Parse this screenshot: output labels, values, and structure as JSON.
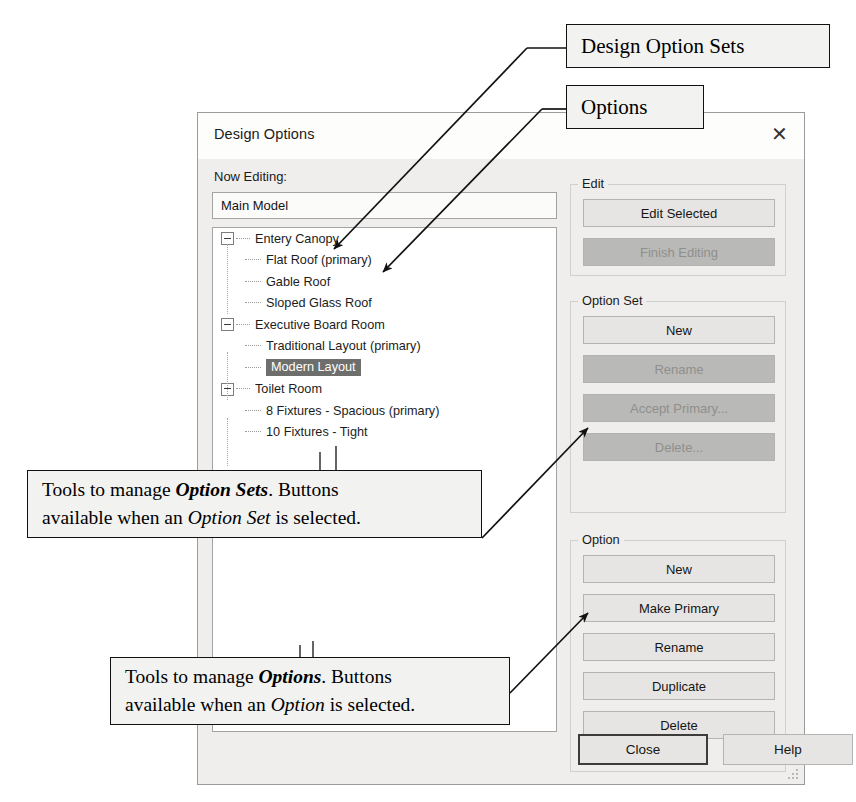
{
  "dialog": {
    "title": "Design Options",
    "close_icon": "close-x-icon",
    "now_editing_label": "Now Editing:",
    "now_editing_value": "Main Model",
    "tree": [
      {
        "type": "set",
        "label": "Entery Canopy",
        "selected": false
      },
      {
        "type": "option",
        "label": "Flat Roof (primary)",
        "selected": false
      },
      {
        "type": "option",
        "label": "Gable Roof",
        "selected": false
      },
      {
        "type": "option",
        "label": "Sloped Glass Roof",
        "selected": false
      },
      {
        "type": "set",
        "label": "Executive Board Room",
        "selected": false
      },
      {
        "type": "option",
        "label": "Traditional Layout (primary)",
        "selected": false
      },
      {
        "type": "option",
        "label": "Modern Layout",
        "selected": true
      },
      {
        "type": "set",
        "label": "Toilet Room",
        "selected": false
      },
      {
        "type": "option",
        "label": "8 Fixtures - Spacious (primary)",
        "selected": false
      },
      {
        "type": "option",
        "label": "10 Fixtures - Tight",
        "selected": false
      }
    ],
    "groups": [
      {
        "title": "Edit",
        "buttons": [
          {
            "label": "Edit Selected",
            "enabled": true
          },
          {
            "label": "Finish Editing",
            "enabled": false
          }
        ]
      },
      {
        "title": "Option Set",
        "buttons": [
          {
            "label": "New",
            "enabled": true
          },
          {
            "label": "Rename",
            "enabled": false
          },
          {
            "label": "Accept Primary...",
            "enabled": false
          },
          {
            "label": "Delete...",
            "enabled": false
          }
        ]
      },
      {
        "title": "Option",
        "buttons": [
          {
            "label": "New",
            "enabled": true
          },
          {
            "label": "Make Primary",
            "enabled": true
          },
          {
            "label": "Rename",
            "enabled": true
          },
          {
            "label": "Duplicate",
            "enabled": true
          },
          {
            "label": "Delete",
            "enabled": true
          }
        ]
      }
    ],
    "footer": {
      "close_label": "Close",
      "help_label": "Help"
    }
  },
  "annotations": {
    "design_option_sets": {
      "text": "Design Option Sets"
    },
    "options": {
      "text": "Options"
    },
    "option_sets_tools": {
      "line1_pre": "Tools to manage ",
      "line1_em": "Option Sets",
      "line1_post": ". Buttons",
      "line2_pre": "available when an ",
      "line2_em": "Option Set",
      "line2_post": " is selected."
    },
    "options_tools": {
      "line1_pre": "Tools to manage ",
      "line1_em": "Options",
      "line1_post": ". Buttons",
      "line2_pre": "available when an ",
      "line2_em": "Option",
      "line2_post": " is selected."
    }
  },
  "colors": {
    "dialog_bg": "#efeeec",
    "titlebar_bg": "#fdfdfc",
    "tree_bg": "#ffffff",
    "selection_bg": "#6e6e6c",
    "button_enabled_bg": "#e6e5e3",
    "button_disabled_bg": "#b9b9b7",
    "annotation_line": "#111111"
  }
}
